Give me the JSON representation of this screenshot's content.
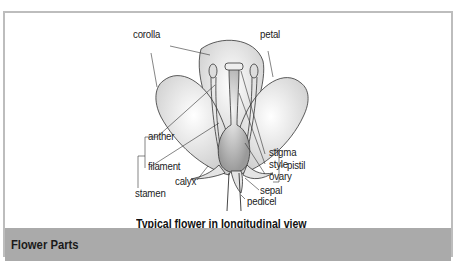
{
  "diagram": {
    "title": "Typical flower in longitudinal view",
    "labels": {
      "corolla": "corolla",
      "petal": "petal",
      "anther": "anther",
      "filament": "filament",
      "stamen": "stamen",
      "calyx": "calyx",
      "stigma": "stigma",
      "style": "style",
      "ovary": "ovary",
      "pistil": "pistil",
      "sepal": "sepal",
      "pedicel": "pedicel"
    }
  },
  "footer": {
    "title": "Flower Parts",
    "background": "#aaaaaa"
  },
  "colors": {
    "frame_border": "#bdbdbd",
    "line": "#333333"
  }
}
